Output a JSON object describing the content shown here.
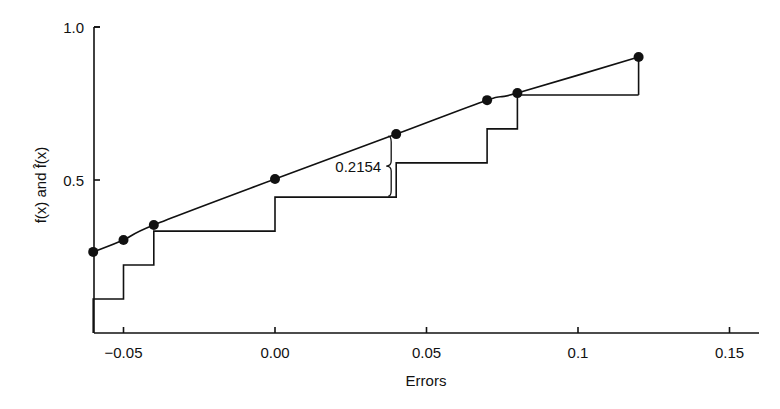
{
  "chart_data": {
    "type": "line",
    "title": "",
    "xlabel": "Errors",
    "ylabel": "f(x) and f̂(x)",
    "xlim": [
      -0.06,
      0.16
    ],
    "ylim": [
      0,
      1.0
    ],
    "grid": false,
    "legend": null,
    "x_ticks": [
      {
        "value": -0.05,
        "label": "−0.05"
      },
      {
        "value": 0.0,
        "label": "0.00"
      },
      {
        "value": 0.05,
        "label": "0.05"
      },
      {
        "value": 0.1,
        "label": "0.1"
      },
      {
        "value": 0.15,
        "label": "0.15"
      }
    ],
    "y_ticks": [
      {
        "value": 0.5,
        "label": "0.5"
      },
      {
        "value": 1.0,
        "label": "1.0"
      }
    ],
    "series": [
      {
        "name": "f(x) (fitted CDF)",
        "kind": "smooth-line-with-markers",
        "x": [
          -0.06,
          -0.05,
          -0.04,
          0.0,
          0.04,
          0.07,
          0.08,
          0.12
        ],
        "y": [
          0.265,
          0.304,
          0.353,
          0.503,
          0.65,
          0.761,
          0.784,
          0.902
        ]
      },
      {
        "name": "f̂(x) (empirical CDF)",
        "kind": "step",
        "x": [
          -0.06,
          -0.05,
          -0.04,
          0.0,
          0.04,
          0.07,
          0.08,
          0.12
        ],
        "y": [
          0.111,
          0.222,
          0.333,
          0.444,
          0.556,
          0.667,
          0.778,
          0.778
        ]
      }
    ],
    "annotations": [
      {
        "type": "brace",
        "x": 0.04,
        "y_from": 0.444,
        "y_to": 0.65,
        "label": "0.2154"
      }
    ]
  }
}
